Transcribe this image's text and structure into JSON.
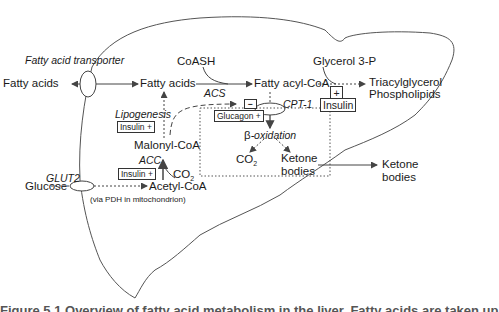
{
  "diagram": {
    "nodes": {
      "fatty_acids_outside": "Fatty acids",
      "fatty_acid_transporter": "Fatty acid transporter",
      "fatty_acids_inside": "Fatty acids",
      "coash": "CoASH",
      "fatty_acyl_coa": "Fatty acyl-CoA",
      "acs": "ACS",
      "glycerol_3p": "Glycerol 3-P",
      "triacylglycerol": "Triacylglycerol",
      "phospholipids": "Phospholipids",
      "lipogenesis": "Lipogenesis",
      "malonyl_coa": "Malonyl-CoA",
      "acc": "ACC",
      "co2_acc": "CO",
      "co2_acc_sub": "2",
      "cpt1": "CPT-1",
      "beta_oxidation_beta": "β",
      "beta_oxidation": "-oxidation",
      "co2_beta": "CO",
      "co2_beta_sub": "2",
      "ketone_bodies_inside_1": "Ketone",
      "ketone_bodies_inside_2": "bodies",
      "ketone_bodies_outside_1": "Ketone",
      "ketone_bodies_outside_2": "bodies",
      "glut2": "GLUT2",
      "glucose": "Glucose",
      "acetyl_coa": "Acetyl-CoA",
      "pdh_note": "(via PDH in mitochondrion)"
    },
    "regulators": {
      "insulin_lipogenesis": "Insulin +",
      "insulin_acc": "Insulin +",
      "glucagon": "Glucagon +",
      "insulin_tag_plus": "+",
      "insulin_tag": "Insulin",
      "malonyl_inhibit": "−"
    },
    "caption": "Figure 5.1  Overview of fatty acid metabolism in the liver. Fatty acids are taken up"
  }
}
